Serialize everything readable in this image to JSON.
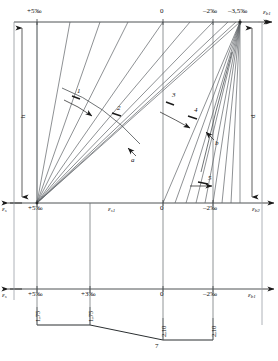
{
  "figure": {
    "type": "strain-distribution-diagram",
    "number": "7"
  },
  "top_axis": {
    "name": "top-strain-axis",
    "axis_symbol": "ε",
    "axis_subscript": "b1",
    "ticks": [
      {
        "label": "+5‰",
        "x": 37
      },
      {
        "label": "0",
        "x": 163
      },
      {
        "label": "–2‰",
        "x": 213
      },
      {
        "label": "–3,5‰",
        "x": 240
      }
    ]
  },
  "mid_axis": {
    "name": "mid-strain-axis",
    "left_symbol": "ε",
    "left_subscript": "s",
    "right_symbol": "ε",
    "right_subscript": "b2",
    "ticks": [
      {
        "label": "+5‰",
        "x": 37
      },
      {
        "label": "0",
        "x": 163
      },
      {
        "label": "–2‰",
        "x": 213
      }
    ],
    "mid_symbol": "ε",
    "mid_subscript": "s1"
  },
  "bottom_axis": {
    "name": "bottom-strain-axis",
    "left_symbol": "ε",
    "left_subscript": "s",
    "right_symbol": "ε",
    "right_subscript": "b1",
    "ticks": [
      {
        "label": "+5‰",
        "x": 37
      },
      {
        "label": "+3‰",
        "x": 90
      },
      {
        "label": "0",
        "x": 163
      },
      {
        "label": "–2‰",
        "x": 213
      }
    ]
  },
  "dimensions": {
    "height_symbol": "h",
    "depth_symbol": "d",
    "values": [
      {
        "label": "1,75",
        "x": 44
      },
      {
        "label": "1,75",
        "x": 90
      },
      {
        "label": "2,10",
        "x": 157
      },
      {
        "label": "2,10",
        "x": 200
      }
    ],
    "caption": "7"
  },
  "zone_labels": [
    {
      "name": "zone-1",
      "label": "1",
      "x": 80,
      "y": 92
    },
    {
      "name": "zone-2",
      "label": "2",
      "x": 119,
      "y": 108
    },
    {
      "name": "zone-3",
      "label": "3",
      "x": 174,
      "y": 96
    },
    {
      "name": "zone-4",
      "label": "4",
      "x": 196,
      "y": 110
    },
    {
      "name": "zone-5",
      "label": "5",
      "x": 210,
      "y": 178
    }
  ],
  "curve_labels": [
    {
      "name": "curve-a",
      "label": "a",
      "x": 133,
      "y": 160
    },
    {
      "name": "curve-b",
      "label": "b",
      "x": 216,
      "y": 143
    }
  ],
  "geometry": {
    "top_y": 22,
    "mid_y": 203,
    "bottom_y": 289,
    "x_left": 14,
    "x_plus5": 37,
    "x_plus3": 90,
    "x_zero": 163,
    "x_minus2": 213,
    "x_minus35": 240,
    "x_right": 262
  },
  "colors": {
    "line": "#55595c",
    "heavy": "#1a1a1a",
    "text": "#111111"
  }
}
